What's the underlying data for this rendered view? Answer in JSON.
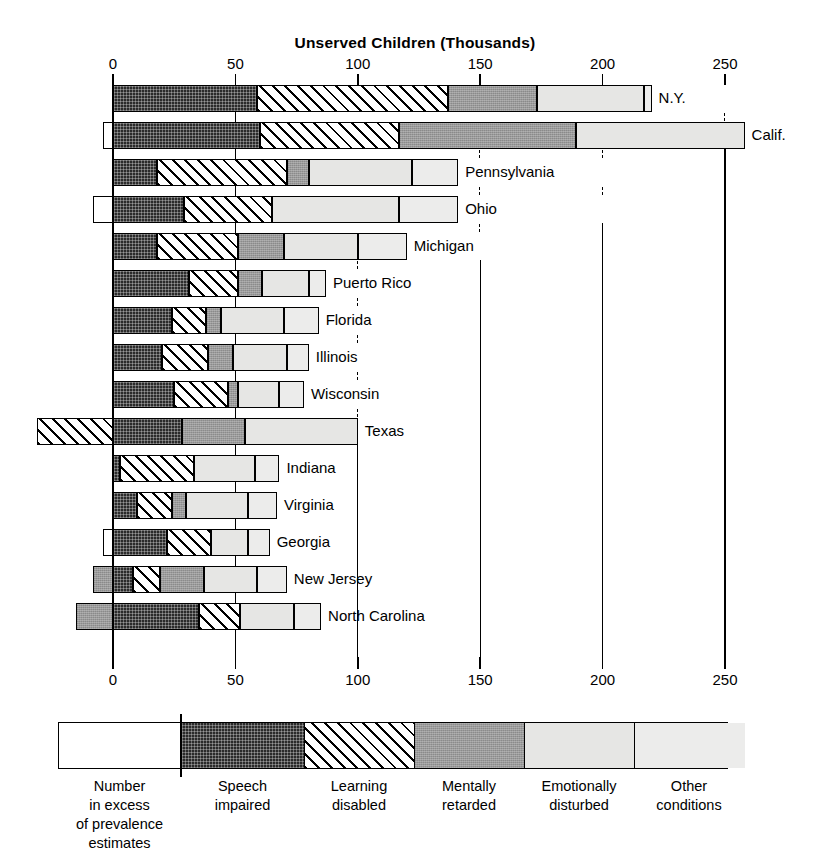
{
  "chart_data": {
    "type": "bar",
    "orientation": "horizontal",
    "stacked": true,
    "title": "Unserved Children (Thousands)",
    "xlabel": "Unserved Children (Thousands)",
    "ylabel": "",
    "xlim": [
      -35,
      265
    ],
    "xticks": [
      0,
      50,
      100,
      150,
      200,
      250
    ],
    "xtick_labels": [
      "0",
      "50",
      "100",
      "150",
      "200",
      "250"
    ],
    "grid": true,
    "legend_position": "bottom",
    "categories": [
      "N.Y.",
      "Calif.",
      "Pennsylvania",
      "Ohio",
      "Michigan",
      "Puerto Rico",
      "Florida",
      "Illinois",
      "Wisconsin",
      "Texas",
      "Indiana",
      "Virginia",
      "Georgia",
      "New Jersey",
      "North Carolina"
    ],
    "series": [
      {
        "name": "Number in excess of prevalence estimates",
        "values": [
          0,
          -4,
          0,
          -8,
          0,
          0,
          0,
          0,
          0,
          -31,
          0,
          0,
          -4,
          -8,
          -15
        ]
      },
      {
        "name": "Speech impaired",
        "values": [
          59,
          60,
          18,
          29,
          18,
          31,
          24,
          20,
          25,
          28,
          3,
          10,
          22,
          8,
          35
        ]
      },
      {
        "name": "Learning disabled",
        "values": [
          78,
          57,
          53,
          36,
          33,
          20,
          14,
          19,
          22,
          0,
          30,
          14,
          18,
          11,
          17
        ]
      },
      {
        "name": "Mentally retarded",
        "values": [
          36,
          72,
          9,
          0,
          19,
          10,
          6,
          10,
          4,
          26,
          0,
          6,
          0,
          18,
          0
        ]
      },
      {
        "name": "Emotionally disturbed",
        "values": [
          44,
          69,
          42,
          52,
          30,
          19,
          26,
          22,
          17,
          46,
          25,
          25,
          15,
          22,
          22
        ]
      },
      {
        "name": "Other conditions",
        "values": [
          3,
          0,
          19,
          24,
          20,
          7,
          14,
          9,
          10,
          0,
          10,
          12,
          9,
          12,
          11
        ]
      }
    ],
    "totals": [
      260,
      254,
      141,
      141,
      120,
      87,
      84,
      80,
      78,
      100,
      68,
      67,
      60,
      63,
      70
    ]
  },
  "header": {
    "title": "Unserved Children (Thousands)"
  },
  "axis": {
    "top_ticks": [
      "0",
      "50",
      "100",
      "150",
      "200",
      "250"
    ],
    "bottom_ticks": [
      "0",
      "50",
      "100",
      "150",
      "200",
      "250"
    ]
  },
  "rows": [
    {
      "label": "N.Y."
    },
    {
      "label": "Calif."
    },
    {
      "label": "Pennsylvania"
    },
    {
      "label": "Ohio"
    },
    {
      "label": "Michigan"
    },
    {
      "label": "Puerto Rico"
    },
    {
      "label": "Florida"
    },
    {
      "label": "Illinois"
    },
    {
      "label": "Wisconsin"
    },
    {
      "label": "Texas"
    },
    {
      "label": "Indiana"
    },
    {
      "label": "Virginia"
    },
    {
      "label": "Georgia"
    },
    {
      "label": "New Jersey"
    },
    {
      "label": "North Carolina"
    }
  ],
  "legend": {
    "items": [
      {
        "key": "excess",
        "line1": "Number",
        "line2": "in excess",
        "line3": "of prevalence",
        "line4": "estimates"
      },
      {
        "key": "speech",
        "line1": "Speech",
        "line2": "impaired",
        "line3": "",
        "line4": ""
      },
      {
        "key": "learning",
        "line1": "Learning",
        "line2": "disabled",
        "line3": "",
        "line4": ""
      },
      {
        "key": "mental",
        "line1": "Mentally",
        "line2": "retarded",
        "line3": "",
        "line4": ""
      },
      {
        "key": "emotional",
        "line1": "Emotionally",
        "line2": "disturbed",
        "line3": "",
        "line4": ""
      },
      {
        "key": "other",
        "line1": "Other",
        "line2": "conditions",
        "line3": "",
        "line4": ""
      }
    ]
  },
  "colors": {
    "ink": "#000000",
    "speech_impaired": "#2b2b2b",
    "mentally_retarded": "#9a9a9a",
    "emotionally_disturbed": "#e6e6e4",
    "other_conditions": "#ececeb",
    "background": "#ffffff"
  }
}
